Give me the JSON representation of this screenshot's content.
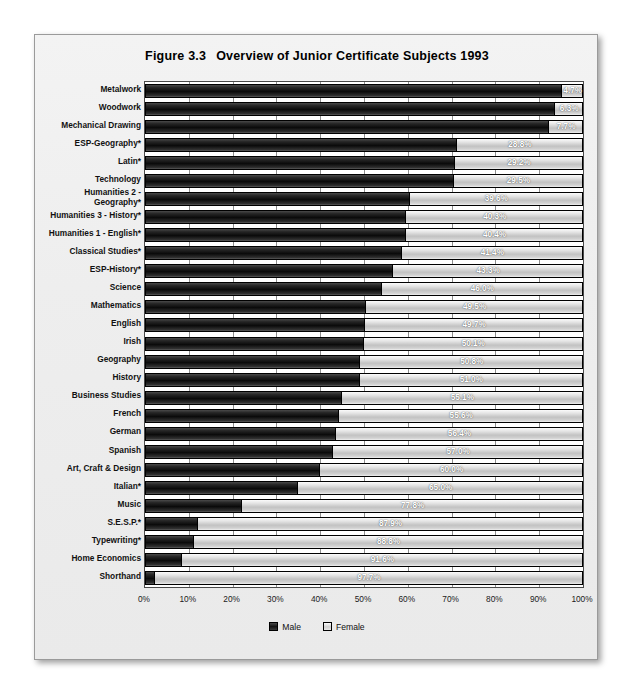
{
  "figure": {
    "number": "Figure 3.3",
    "title": "Overview of Junior Certificate Subjects 1993"
  },
  "legend": {
    "items": [
      {
        "label": "Male",
        "color": "#141414",
        "key": "male"
      },
      {
        "label": "Female",
        "color": "#d0d0d0",
        "key": "female"
      }
    ]
  },
  "axis": {
    "ticks": [
      "0%",
      "10%",
      "20%",
      "30%",
      "40%",
      "50%",
      "60%",
      "70%",
      "80%",
      "90%",
      "100%"
    ],
    "min": 0,
    "max": 100
  },
  "chart_data": {
    "type": "bar",
    "orientation": "horizontal",
    "stacked": true,
    "normalized_percent": true,
    "xlabel": "",
    "ylabel": "",
    "xlim": [
      0,
      100
    ],
    "grid": true,
    "legend_position": "bottom-center",
    "categories": [
      "Metalwork",
      "Woodwork",
      "Mechanical Drawing",
      "ESP-Geography*",
      "Latin*",
      "Technology",
      "Humanities 2 -\nGeography*",
      "Humanities 3 - History*",
      "Humanities 1 - English*",
      "Classical Studies*",
      "ESP-History*",
      "Science",
      "Mathematics",
      "English",
      "Irish",
      "Geography",
      "History",
      "Business Studies",
      "French",
      "German",
      "Spanish",
      "Art, Craft & Design",
      "Italian*",
      "Music",
      "S.E.S.P.*",
      "Typewriting*",
      "Home Economics",
      "Shorthand"
    ],
    "series": [
      {
        "name": "Male",
        "values": [
          95.3,
          93.7,
          92.3,
          71.2,
          70.8,
          70.5,
          60.4,
          59.7,
          59.6,
          58.6,
          56.7,
          54.0,
          50.5,
          50.3,
          49.9,
          49.2,
          49.0,
          44.9,
          44.4,
          43.6,
          43.0,
          40.0,
          35.0,
          22.2,
          12.1,
          11.2,
          8.4,
          2.3
        ]
      },
      {
        "name": "Female",
        "values": [
          4.7,
          6.3,
          7.7,
          28.8,
          29.2,
          29.5,
          39.6,
          40.3,
          40.4,
          41.4,
          43.3,
          46.0,
          49.5,
          49.7,
          50.1,
          50.8,
          51.0,
          55.1,
          55.6,
          56.4,
          57.0,
          60.0,
          65.0,
          77.8,
          87.9,
          88.8,
          91.6,
          97.7
        ]
      }
    ],
    "data_labels": [
      "4.7%",
      "6.3%",
      "7.7%",
      "28.8%",
      "29.2%",
      "29.5%",
      "39.6%",
      "40.3%",
      "40.4%",
      "41.4%",
      "43.3%",
      "46.0%",
      "49.5%",
      "49.7%",
      "50.1%",
      "50.8%",
      "51.0%",
      "55.1%",
      "55.6%",
      "56.4%",
      "57.0%",
      "60.0%",
      "65.0%",
      "77.8%",
      "87.9%",
      "88.8%",
      "91.6%",
      "97.7%"
    ],
    "data_label_series": "Female"
  }
}
